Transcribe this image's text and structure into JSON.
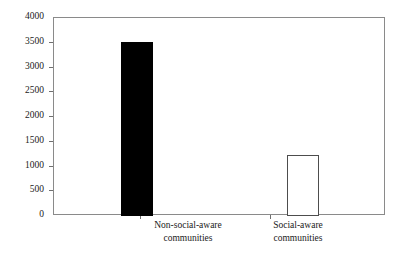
{
  "chart_data": {
    "type": "bar",
    "title": "",
    "subtitle": "",
    "xlabel": "",
    "ylabel": "",
    "categories": [
      "Non-social-aware\ncommunities",
      "Social-aware\ncommunities"
    ],
    "category_labels_flat": [
      "Non-social-aware communities",
      "Social-aware communities"
    ],
    "values": [
      3510,
      1240
    ],
    "series": [
      {
        "name": "communities",
        "values": [
          3510,
          1240
        ]
      }
    ],
    "ylim": [
      0,
      4000
    ],
    "y_ticks": [
      0,
      500,
      1000,
      1500,
      2000,
      2500,
      3000,
      3500,
      4000
    ],
    "y_tick_labels": [
      "0",
      "500",
      "1000",
      "1500",
      "2000",
      "2500",
      "3000",
      "3500",
      "4000"
    ],
    "grid": false,
    "legend": false,
    "legend_position": "none",
    "bar_styles": [
      "filled-black",
      "open-white"
    ],
    "colors": {
      "bar_filled": "#000000",
      "bar_open_face": "#ffffff",
      "bar_open_edge": "#4d4d4d",
      "axis": "#8a8a8a",
      "tick": "#6f6f6f",
      "text": "#1a1a1a",
      "background": "#ffffff"
    }
  }
}
